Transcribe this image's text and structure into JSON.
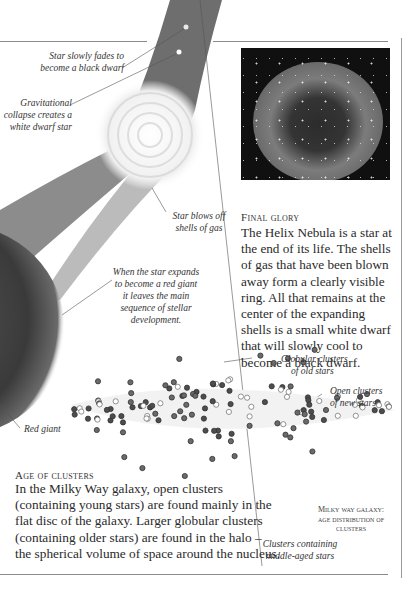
{
  "illustration": {
    "labels": {
      "fades": [
        "Star slowly fades to",
        "become a black dwarf"
      ],
      "collapse": [
        "Gravitational",
        "collapse creates a",
        "white dwarf star"
      ],
      "blows_off": [
        "Star blows off",
        "shells of gas"
      ],
      "red_giant_expand": [
        "When the star expands",
        "to become a red giant",
        "it leaves the main",
        "sequence of stellar",
        "development."
      ],
      "red_giant": "Red giant"
    }
  },
  "final_glory": {
    "heading": "Final glory",
    "body": "The Helix Nebula is a star at the end of its life. The shells of gas that have been blown away form a clearly visible ring. All that remains at the center of the expanding shells is a small white dwarf that will slowly cool to become a black dwarf.",
    "image_alt": "Helix Nebula photograph"
  },
  "clusters_diagram": {
    "labels": {
      "globular": [
        "Globular clusters",
        "of old stars"
      ],
      "open": [
        "Open clusters",
        "of new stars"
      ],
      "middle": [
        "Clusters containing",
        "middle-aged stars"
      ]
    },
    "caption": [
      "Milky way galaxy:",
      "age distribution of",
      "clusters"
    ]
  },
  "age_of_clusters": {
    "heading": "Age of clusters",
    "body_lines": [
      "In the Milky Way galaxy, open clusters",
      "(containing young stars) are found mainly in the",
      "flat disc of the galaxy. Larger globular clusters",
      "(containing older stars) are found in the halo –",
      "the spherical volume of space around the nucleus."
    ]
  },
  "colors": {
    "rule": "#8a8a8a",
    "band_dark": "#4a4a4a",
    "red_giant": "#3c3c3c",
    "nebula_bg": "#111111",
    "dot_dark": "#4d4d4d",
    "dot_light": "#bdbdbd"
  }
}
